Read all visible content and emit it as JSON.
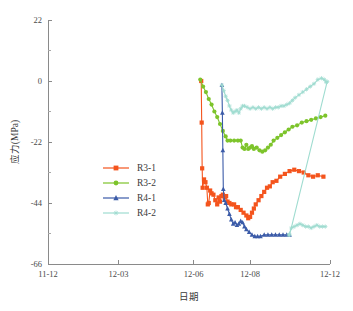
{
  "chart_data": {
    "type": "line",
    "title": "",
    "xlabel": "日期",
    "ylabel": "应力(MPa)",
    "xlim": [
      0,
      30
    ],
    "ylim": [
      -66,
      22
    ],
    "grid": false,
    "legend_position": "center-left",
    "y_ticks": [
      22,
      0,
      -22,
      -44,
      -66
    ],
    "y_tick_labels": [
      "22",
      "0",
      "-22",
      "-44",
      "-66"
    ],
    "y_minor_count": 1,
    "x_ticks": [
      0,
      7.5,
      15.5,
      21.5,
      30
    ],
    "x_tick_labels": [
      "11-12",
      "12-03",
      "12-06",
      "12-08",
      "12-12"
    ],
    "series": [
      {
        "name": "R3-1",
        "color": "#f4541d",
        "marker": "square",
        "points": [
          [
            16.3,
            0.0
          ],
          [
            16.35,
            -15.0
          ],
          [
            16.4,
            -31.5
          ],
          [
            16.45,
            -38.5
          ],
          [
            16.6,
            -35.5
          ],
          [
            16.75,
            -36.5
          ],
          [
            16.9,
            -38.5
          ],
          [
            17.0,
            -44.5
          ],
          [
            17.1,
            -44.0
          ],
          [
            17.25,
            -39.5
          ],
          [
            17.4,
            -40.5
          ],
          [
            17.6,
            -41.0
          ],
          [
            17.8,
            -43.0
          ],
          [
            18.0,
            -44.5
          ],
          [
            18.15,
            -42.0
          ],
          [
            18.3,
            -43.5
          ],
          [
            18.45,
            -41.5
          ],
          [
            18.6,
            -41.0
          ],
          [
            18.8,
            -42.0
          ],
          [
            18.95,
            -41.5
          ],
          [
            19.1,
            -43.5
          ],
          [
            19.3,
            -44.0
          ],
          [
            19.5,
            -44.5
          ],
          [
            19.8,
            -44.5
          ],
          [
            20.0,
            -45.5
          ],
          [
            20.2,
            -45.5
          ],
          [
            20.5,
            -46.5
          ],
          [
            20.8,
            -47.5
          ],
          [
            21.1,
            -48.5
          ],
          [
            21.3,
            -49.5
          ],
          [
            21.5,
            -49.0
          ],
          [
            21.7,
            -47.5
          ],
          [
            21.9,
            -46.0
          ],
          [
            22.1,
            -44.5
          ],
          [
            22.4,
            -43.0
          ],
          [
            22.7,
            -41.5
          ],
          [
            23.0,
            -40.0
          ],
          [
            23.3,
            -38.5
          ],
          [
            23.6,
            -38.0
          ],
          [
            23.9,
            -36.5
          ],
          [
            24.3,
            -36.0
          ],
          [
            24.7,
            -34.5
          ],
          [
            25.2,
            -33.5
          ],
          [
            25.7,
            -32.5
          ],
          [
            26.2,
            -32.0
          ],
          [
            26.7,
            -32.5
          ],
          [
            27.2,
            -33.0
          ],
          [
            27.7,
            -34.0
          ],
          [
            28.2,
            -34.5
          ],
          [
            28.7,
            -34.0
          ],
          [
            29.3,
            -34.5
          ]
        ]
      },
      {
        "name": "R3-2",
        "color": "#7dc42b",
        "marker": "circle",
        "points": [
          [
            16.2,
            0.5
          ],
          [
            16.5,
            -2.0
          ],
          [
            16.8,
            -4.0
          ],
          [
            17.1,
            -6.5
          ],
          [
            17.4,
            -8.5
          ],
          [
            17.7,
            -11.0
          ],
          [
            18.0,
            -13.0
          ],
          [
            18.3,
            -15.5
          ],
          [
            18.6,
            -18.0
          ],
          [
            18.9,
            -20.0
          ],
          [
            19.1,
            -21.5
          ],
          [
            19.4,
            -21.5
          ],
          [
            19.8,
            -21.5
          ],
          [
            20.2,
            -21.5
          ],
          [
            20.5,
            -21.5
          ],
          [
            20.7,
            -24.0
          ],
          [
            20.9,
            -24.5
          ],
          [
            21.1,
            -23.0
          ],
          [
            21.3,
            -24.5
          ],
          [
            21.5,
            -24.0
          ],
          [
            21.7,
            -23.5
          ],
          [
            21.9,
            -24.5
          ],
          [
            22.2,
            -24.0
          ],
          [
            22.5,
            -25.0
          ],
          [
            22.8,
            -25.5
          ],
          [
            23.1,
            -25.0
          ],
          [
            23.4,
            -24.0
          ],
          [
            23.7,
            -23.0
          ],
          [
            24.0,
            -21.5
          ],
          [
            24.4,
            -20.5
          ],
          [
            24.8,
            -19.5
          ],
          [
            25.2,
            -18.5
          ],
          [
            25.6,
            -17.5
          ],
          [
            26.0,
            -16.5
          ],
          [
            26.5,
            -16.0
          ],
          [
            27.0,
            -15.0
          ],
          [
            27.5,
            -14.5
          ],
          [
            28.0,
            -14.0
          ],
          [
            28.5,
            -13.5
          ],
          [
            29.0,
            -13.0
          ],
          [
            29.5,
            -12.5
          ]
        ]
      },
      {
        "name": "R4-1",
        "color": "#3b5ba8",
        "marker": "triangle",
        "points": [
          [
            18.5,
            -1.5
          ],
          [
            18.55,
            -11.5
          ],
          [
            18.6,
            -25.0
          ],
          [
            18.65,
            -39.0
          ],
          [
            18.75,
            -43.0
          ],
          [
            18.9,
            -44.0
          ],
          [
            19.1,
            -46.0
          ],
          [
            19.3,
            -48.0
          ],
          [
            19.5,
            -50.0
          ],
          [
            19.7,
            -51.5
          ],
          [
            19.9,
            -51.0
          ],
          [
            20.1,
            -52.0
          ],
          [
            20.3,
            -51.5
          ],
          [
            20.5,
            -50.5
          ],
          [
            20.7,
            -51.0
          ],
          [
            20.9,
            -52.5
          ],
          [
            21.1,
            -53.5
          ],
          [
            21.4,
            -54.5
          ],
          [
            21.7,
            -55.5
          ],
          [
            22.0,
            -56.0
          ],
          [
            22.3,
            -56.0
          ],
          [
            22.6,
            -56.0
          ],
          [
            23.0,
            -55.5
          ],
          [
            23.4,
            -55.5
          ],
          [
            23.8,
            -55.5
          ],
          [
            24.2,
            -55.5
          ],
          [
            24.6,
            -55.5
          ],
          [
            25.0,
            -55.5
          ],
          [
            25.4,
            -55.5
          ],
          [
            25.7,
            -55.5
          ]
        ]
      },
      {
        "name": "R4-2",
        "color": "#9fdcd0",
        "marker": "star",
        "points": [
          [
            18.5,
            -1.5
          ],
          [
            18.7,
            -3.5
          ],
          [
            18.9,
            -5.5
          ],
          [
            19.1,
            -7.0
          ],
          [
            19.3,
            -9.0
          ],
          [
            19.5,
            -10.5
          ],
          [
            19.7,
            -11.5
          ],
          [
            19.9,
            -11.0
          ],
          [
            20.1,
            -10.5
          ],
          [
            20.3,
            -11.5
          ],
          [
            20.5,
            -10.0
          ],
          [
            20.7,
            -9.0
          ],
          [
            20.9,
            -9.0
          ],
          [
            21.2,
            -9.5
          ],
          [
            21.5,
            -10.0
          ],
          [
            21.8,
            -9.5
          ],
          [
            22.1,
            -10.0
          ],
          [
            22.4,
            -9.5
          ],
          [
            22.7,
            -10.0
          ],
          [
            23.0,
            -9.5
          ],
          [
            23.3,
            -10.0
          ],
          [
            23.6,
            -9.5
          ],
          [
            23.9,
            -10.0
          ],
          [
            24.2,
            -9.5
          ],
          [
            24.5,
            -9.5
          ],
          [
            24.8,
            -9.0
          ],
          [
            25.1,
            -9.0
          ],
          [
            25.4,
            -8.5
          ],
          [
            25.7,
            -8.0
          ],
          [
            26.0,
            -7.0
          ],
          [
            26.3,
            -6.0
          ],
          [
            26.7,
            -5.0
          ],
          [
            27.1,
            -4.0
          ],
          [
            27.5,
            -3.0
          ],
          [
            27.9,
            -2.0
          ],
          [
            28.3,
            -1.0
          ],
          [
            28.7,
            0.5
          ],
          [
            29.1,
            1.0
          ],
          [
            29.4,
            0.5
          ],
          [
            29.6,
            -0.5
          ],
          [
            29.7,
            -0.2
          ],
          [
            25.7,
            -55.5
          ]
        ]
      },
      {
        "name": "R4-2-tail",
        "color": "#9fdcd0",
        "marker": "star",
        "points": [
          [
            25.6,
            -55.5
          ],
          [
            25.9,
            -53.0
          ],
          [
            26.2,
            -52.5
          ],
          [
            26.5,
            -52.0
          ],
          [
            26.8,
            -51.5
          ],
          [
            27.1,
            -52.0
          ],
          [
            27.4,
            -52.5
          ],
          [
            27.7,
            -52.5
          ],
          [
            28.0,
            -53.0
          ],
          [
            28.3,
            -52.5
          ],
          [
            28.6,
            -52.0
          ],
          [
            28.9,
            -52.5
          ],
          [
            29.2,
            -52.5
          ],
          [
            29.5,
            -52.5
          ]
        ]
      }
    ]
  },
  "legend": {
    "entries": [
      {
        "label": "R3-1",
        "color": "#f4541d",
        "marker": "square"
      },
      {
        "label": "R3-2",
        "color": "#7dc42b",
        "marker": "circle"
      },
      {
        "label": "R4-1",
        "color": "#3b5ba8",
        "marker": "triangle"
      },
      {
        "label": "R4-2",
        "color": "#9fdcd0",
        "marker": "star"
      }
    ]
  }
}
